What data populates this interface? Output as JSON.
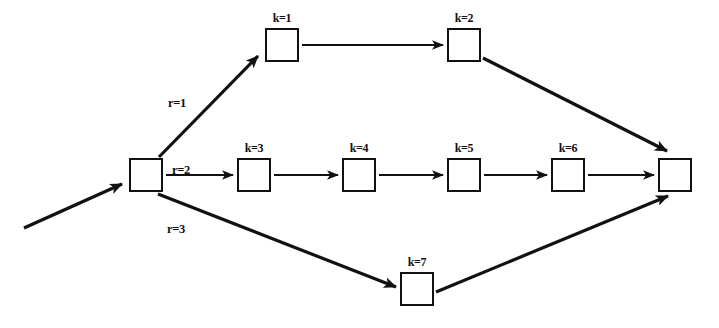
{
  "diagram": {
    "type": "directed-graph",
    "colors": {
      "stroke": "#111111",
      "background": "#ffffff",
      "node_fill": "#ffffff"
    },
    "nodes": [
      {
        "id": "source",
        "label": "",
        "x": 129,
        "y": 158,
        "w": 34,
        "h": 34,
        "label_text": ""
      },
      {
        "id": "k1",
        "label": "k=1",
        "x": 265,
        "y": 28,
        "w": 34,
        "h": 34
      },
      {
        "id": "k2",
        "label": "k=2",
        "x": 447,
        "y": 28,
        "w": 34,
        "h": 34
      },
      {
        "id": "k3",
        "label": "k=3",
        "x": 237,
        "y": 158,
        "w": 34,
        "h": 34
      },
      {
        "id": "k4",
        "label": "k=4",
        "x": 342,
        "y": 158,
        "w": 34,
        "h": 34
      },
      {
        "id": "k5",
        "label": "k=5",
        "x": 447,
        "y": 158,
        "w": 34,
        "h": 34
      },
      {
        "id": "k6",
        "label": "k=6",
        "x": 551,
        "y": 158,
        "w": 34,
        "h": 34
      },
      {
        "id": "k7",
        "label": "k=7",
        "x": 400,
        "y": 272,
        "w": 34,
        "h": 34
      },
      {
        "id": "sink",
        "label": "",
        "x": 658,
        "y": 158,
        "w": 34,
        "h": 34,
        "label_text": ""
      }
    ],
    "edge_labels": [
      {
        "id": "r1",
        "text": "r=1",
        "x": 168,
        "y": 96
      },
      {
        "id": "r2",
        "text": "r=2",
        "x": 172,
        "y": 163
      },
      {
        "id": "r3",
        "text": "r=3",
        "x": 167,
        "y": 222
      }
    ],
    "edges": [
      {
        "id": "entry",
        "from": "",
        "to": "source",
        "weight": "thick"
      },
      {
        "id": "source-k1",
        "from": "source",
        "to": "k1",
        "label": "r=1",
        "weight": "thick"
      },
      {
        "id": "k1-k2",
        "from": "k1",
        "to": "k2",
        "weight": "thin"
      },
      {
        "id": "k2-sink",
        "from": "k2",
        "to": "sink",
        "weight": "thick"
      },
      {
        "id": "source-k3",
        "from": "source",
        "to": "k3",
        "label": "r=2",
        "weight": "thin"
      },
      {
        "id": "k3-k4",
        "from": "k3",
        "to": "k4",
        "weight": "thin"
      },
      {
        "id": "k4-k5",
        "from": "k4",
        "to": "k5",
        "weight": "thin"
      },
      {
        "id": "k5-k6",
        "from": "k5",
        "to": "k6",
        "weight": "thin"
      },
      {
        "id": "k6-sink",
        "from": "k6",
        "to": "sink",
        "weight": "thin"
      },
      {
        "id": "source-k7",
        "from": "source",
        "to": "k7",
        "label": "r=3",
        "weight": "thick"
      },
      {
        "id": "k7-sink",
        "from": "k7",
        "to": "sink",
        "weight": "thick"
      }
    ]
  }
}
